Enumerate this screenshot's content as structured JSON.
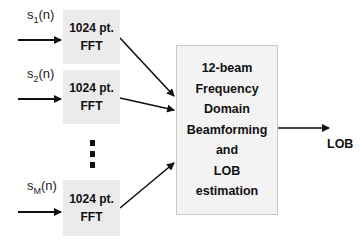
{
  "inputs": [
    {
      "signal_base": "s",
      "signal_sub": "1",
      "signal_arg": "(n)",
      "block_line1": "1024 pt.",
      "block_line2": "FFT"
    },
    {
      "signal_base": "s",
      "signal_sub": "2",
      "signal_arg": "(n)",
      "block_line1": "1024 pt.",
      "block_line2": "FFT"
    },
    {
      "signal_base": "s",
      "signal_sub": "M",
      "signal_arg": "(n)",
      "block_line1": "1024 pt.",
      "block_line2": "FFT"
    }
  ],
  "main_block": {
    "lines": [
      "12-beam",
      "Frequency",
      "Domain",
      "Beamforming",
      "and",
      "LOB",
      "estimation"
    ]
  },
  "output": {
    "label": "LOB"
  },
  "ellipsis": "vertical-dots"
}
